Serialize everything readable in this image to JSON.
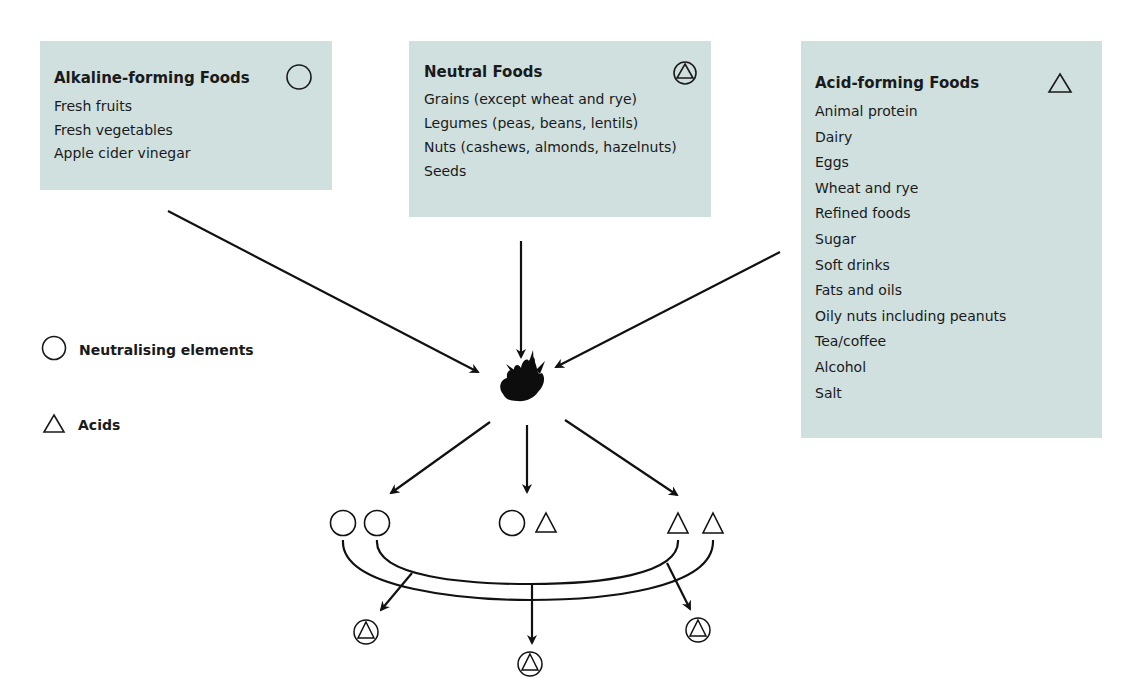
{
  "boxes": {
    "alkaline": {
      "title": "Alkaline-forming Foods",
      "symbol": "circle-icon",
      "items": [
        "Fresh fruits",
        "Fresh vegetables",
        "Apple cider vinegar"
      ]
    },
    "neutral": {
      "title": "Neutral Foods",
      "symbol": "circle-triangle-icon",
      "items": [
        "Grains (except wheat and rye)",
        "Legumes (peas, beans, lentils)",
        "Nuts (cashews, almonds, hazelnuts)",
        "Seeds"
      ]
    },
    "acid": {
      "title": "Acid-forming Foods",
      "symbol": "triangle-icon",
      "items": [
        "Animal protein",
        "Dairy",
        "Eggs",
        "Wheat and rye",
        "Refined foods",
        "Sugar",
        "Soft drinks",
        "Fats and oils",
        "Oily nuts including peanuts",
        "Tea/coffee",
        "Alcohol",
        "Salt"
      ]
    }
  },
  "legend": {
    "neutralising": "Neutralising elements",
    "acids": "Acids"
  },
  "center": {
    "icon": "fire-icon"
  },
  "outcomes": [
    {
      "symbols": [
        "circle",
        "circle"
      ]
    },
    {
      "symbols": [
        "circle",
        "triangle"
      ]
    },
    {
      "symbols": [
        "triangle",
        "triangle"
      ]
    }
  ],
  "results": [
    "circle-triangle",
    "circle-triangle",
    "circle-triangle"
  ],
  "colors": {
    "box_bg": "#cfe0df",
    "ink": "#1a1a1a"
  }
}
